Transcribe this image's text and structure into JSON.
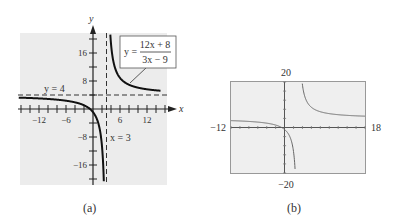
{
  "chart_data": [
    {
      "type": "line",
      "panel": "(a)",
      "title": "",
      "xlabel": "x",
      "ylabel": "y",
      "function": "y = (12x + 8)/(3x - 9)",
      "label_numerator": "12x + 8",
      "label_denominator": "3x − 9",
      "label_prefix": "y =",
      "asymptotes": {
        "horizontal": {
          "value": 4,
          "label": "y = 4"
        },
        "vertical": {
          "value": 3,
          "label": "x = 3"
        }
      },
      "xlim": [
        -15,
        15
      ],
      "ylim": [
        -22,
        22
      ],
      "x_ticks": [
        -12,
        -6,
        6,
        12
      ],
      "y_ticks": [
        16,
        8,
        -8,
        -16
      ],
      "x_tick_labels": [
        "−12",
        "−6",
        "6",
        "12"
      ],
      "y_tick_labels": [
        "16",
        "8",
        "−8",
        "−16"
      ],
      "grid": false,
      "series": [
        {
          "name": "left branch",
          "x": [
            -15,
            -12,
            -9,
            -6,
            -3,
            -1,
            0,
            1,
            2,
            2.5
          ],
          "y": [
            3.11,
            3.05,
            2.78,
            2.37,
            1.56,
            0.33,
            -0.89,
            -3.33,
            -10.67,
            -25.33
          ]
        },
        {
          "name": "right branch",
          "x": [
            3.4,
            4,
            5,
            6,
            8,
            10,
            12,
            15
          ],
          "y": [
            40.67,
            18.67,
            11.33,
            8.89,
            6.93,
            6.1,
            5.63,
            5.22
          ]
        }
      ]
    },
    {
      "type": "line",
      "panel": "(b)",
      "title": "",
      "window": {
        "xmin": -12,
        "xmax": 18,
        "ymin": -20,
        "ymax": 20
      },
      "window_labels": {
        "xmin": "−12",
        "xmax": "18",
        "ymin": "−20",
        "ymax": "20"
      },
      "function": "y = (12x + 8)/(3x - 9)",
      "grid": false,
      "series": [
        {
          "name": "graphing utility plot",
          "x": [
            -12,
            -6,
            0,
            2,
            2.6,
            3.6,
            6,
            12,
            18
          ],
          "y": [
            3.05,
            2.37,
            -0.89,
            -10.67,
            -32,
            31.3,
            8.89,
            5.63,
            4.89
          ]
        }
      ]
    }
  ],
  "captions": {
    "a": "(a)",
    "b": "(b)"
  }
}
